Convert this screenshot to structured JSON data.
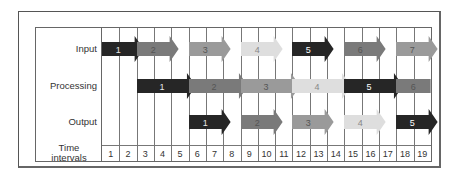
{
  "diagram": {
    "rows": [
      {
        "id": "input",
        "label": "Input"
      },
      {
        "id": "processing",
        "label": "Processing"
      },
      {
        "id": "output",
        "label": "Output"
      }
    ],
    "time_label_line1": "Time",
    "time_label_line2": "intervals",
    "time_intervals": [
      "1",
      "2",
      "3",
      "4",
      "5",
      "6",
      "7",
      "8",
      "9",
      "10",
      "11",
      "12",
      "13",
      "14",
      "15",
      "16",
      "17",
      "18",
      "19"
    ],
    "task_colors": {
      "1": "#262626",
      "2": "#7a7a7a",
      "3": "#9a9a9a",
      "4": "#dedede",
      "5": "#262626",
      "6": "#7a7a7a",
      "7": "#9a9a9a"
    },
    "task_text_colors": {
      "1": "#e8e8e8",
      "2": "#555555",
      "3": "#555555",
      "4": "#888888",
      "5": "#ffffff",
      "6": "#555555",
      "7": "#555555"
    },
    "tasks": {
      "input": [
        {
          "label": "1",
          "start": 1,
          "end": 2
        },
        {
          "label": "2",
          "start": 3,
          "end": 4
        },
        {
          "label": "3",
          "start": 6,
          "end": 7
        },
        {
          "label": "4",
          "start": 9,
          "end": 10
        },
        {
          "label": "5",
          "start": 12,
          "end": 13
        },
        {
          "label": "6",
          "start": 15,
          "end": 16
        },
        {
          "label": "7",
          "start": 18,
          "end": 19
        }
      ],
      "processing": [
        {
          "label": "1",
          "start": 3,
          "end": 5
        },
        {
          "label": "2",
          "start": 6,
          "end": 8
        },
        {
          "label": "3",
          "start": 9,
          "end": 11
        },
        {
          "label": "4",
          "start": 12,
          "end": 14
        },
        {
          "label": "5",
          "start": 15,
          "end": 17
        },
        {
          "label": "6",
          "start": 18,
          "end": 19,
          "flat": true
        }
      ],
      "output": [
        {
          "label": "1",
          "start": 6,
          "end": 7
        },
        {
          "label": "2",
          "start": 9,
          "end": 10
        },
        {
          "label": "3",
          "start": 12,
          "end": 13
        },
        {
          "label": "4",
          "start": 15,
          "end": 16
        },
        {
          "label": "5",
          "start": 18,
          "end": 19
        }
      ]
    }
  }
}
